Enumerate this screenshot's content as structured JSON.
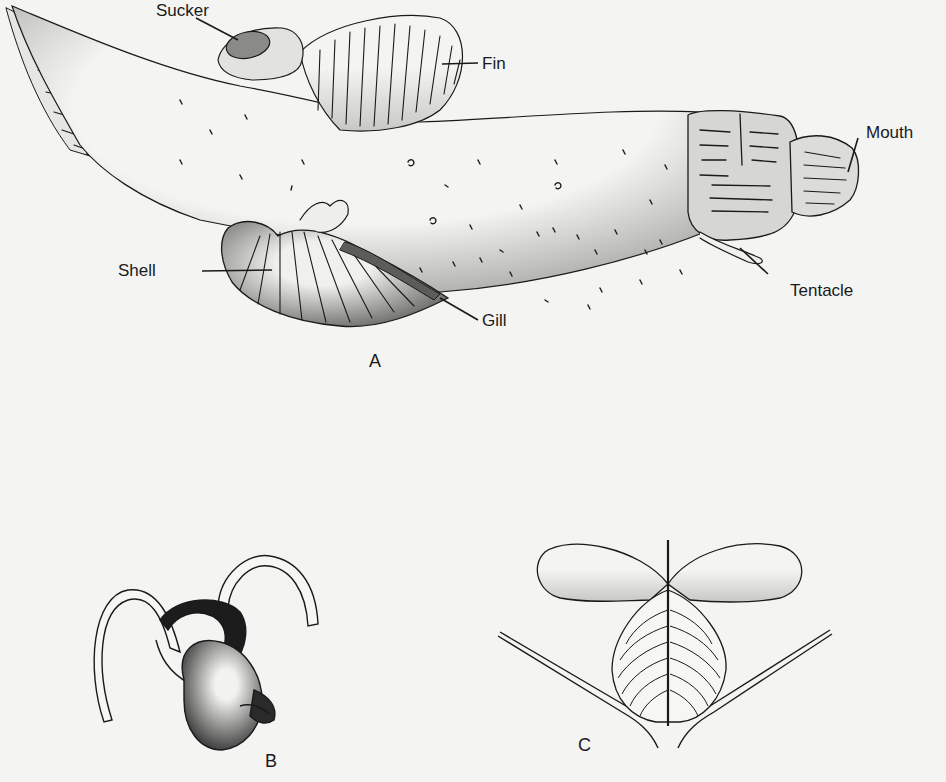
{
  "figure": {
    "panels": [
      {
        "id": "A",
        "letter": "A",
        "labels": {
          "sucker": "Sucker",
          "fin": "Fin",
          "mouth": "Mouth",
          "tentacle": "Tentacle",
          "shell": "Shell",
          "gill": "Gill"
        }
      },
      {
        "id": "B",
        "letter": "B"
      },
      {
        "id": "C",
        "letter": "C"
      }
    ],
    "colors": {
      "ink": "#1a1a1a",
      "paper": "#f4f4f2",
      "shade": "#b8b8b4"
    }
  }
}
